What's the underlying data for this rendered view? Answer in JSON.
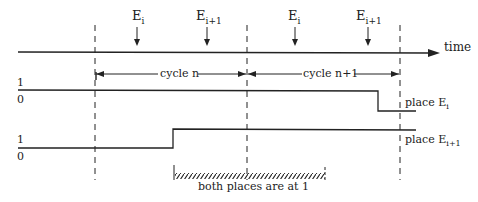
{
  "diagram": {
    "axis": {
      "label": "time"
    },
    "events": [
      {
        "name": "E",
        "sub": "i"
      },
      {
        "name": "E",
        "sub": "i+1"
      },
      {
        "name": "E",
        "sub": "i"
      },
      {
        "name": "E",
        "sub": "i+1"
      }
    ],
    "cycles": [
      {
        "label": "cycle n"
      },
      {
        "label": "cycle n+1"
      }
    ],
    "signals": [
      {
        "high": "1",
        "low": "0",
        "place": "place E",
        "sub": "i"
      },
      {
        "high": "1",
        "low": "0",
        "place": "place E",
        "sub": "i+1"
      }
    ],
    "overlap": {
      "label": "both places are at 1"
    }
  }
}
